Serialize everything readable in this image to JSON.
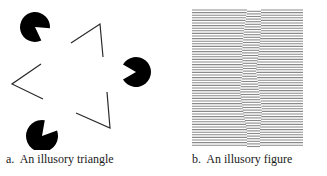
{
  "figure_a": {
    "caption": "a.  An illusory triangle",
    "pacmen": [
      {
        "cx": 35,
        "cy": 27,
        "r": 15,
        "mouth_angle_deg": 35,
        "mouth_width_deg": 60
      },
      {
        "cx": 136,
        "cy": 72,
        "r": 15,
        "mouth_angle_deg": 180,
        "mouth_width_deg": 60
      },
      {
        "cx": 42,
        "cy": 136,
        "r": 16,
        "mouth_angle_deg": -50,
        "mouth_width_deg": 60
      }
    ],
    "corners": [
      {
        "points": [
          [
            71,
            43
          ],
          [
            100,
            24
          ],
          [
            103,
            57
          ]
        ]
      },
      {
        "points": [
          [
            41,
            64
          ],
          [
            12,
            84
          ],
          [
            43,
            99
          ]
        ]
      },
      {
        "points": [
          [
            76,
            113
          ],
          [
            110,
            128
          ],
          [
            107,
            92
          ]
        ]
      }
    ],
    "fill_color": "#000000",
    "line_color": "#2a2a2a"
  },
  "figure_b": {
    "caption": "b.  An illusory figure",
    "x_left": 12,
    "x_right": 123,
    "y_top": 10,
    "y_bottom": 147,
    "line_spacing": 2.6,
    "line_color": "#8a8a8a",
    "band_left_profile": [
      [
        10,
        67
      ],
      [
        30,
        64
      ],
      [
        50,
        62
      ],
      [
        70,
        63
      ],
      [
        90,
        60
      ],
      [
        110,
        63
      ],
      [
        130,
        67
      ],
      [
        147,
        67
      ]
    ],
    "band_right_profile": [
      [
        10,
        81
      ],
      [
        30,
        81
      ],
      [
        50,
        79
      ],
      [
        70,
        76
      ],
      [
        90,
        79
      ],
      [
        110,
        82
      ],
      [
        130,
        80
      ],
      [
        147,
        80
      ]
    ],
    "band_shift": 1.3
  }
}
